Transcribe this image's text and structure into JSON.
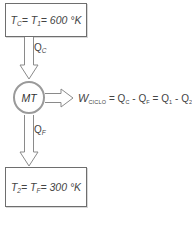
{
  "diagram": {
    "type": "heat-engine-schematic",
    "hot_reservoir": {
      "T_symbol": "T",
      "T_sub": "C",
      "eq1": "= ",
      "T1_symbol": "T",
      "T1_sub": "1",
      "value": "= 600 °K"
    },
    "cold_reservoir": {
      "T_symbol": "T",
      "T_sub": "2",
      "eq1": "= ",
      "Tf_symbol": "T",
      "Tf_sub": "F",
      "value": "= 300 °K"
    },
    "engine": {
      "label": "MT"
    },
    "heat_in": {
      "symbol": "Q",
      "sub": "C"
    },
    "heat_out": {
      "symbol": "Q",
      "sub": "F"
    },
    "work_equation": {
      "W": "W",
      "W_sub": "CICLO",
      "part1": " = Q",
      "part1_sub": "C",
      "part2": " - Q",
      "part2_sub": "F",
      "part3": " = Q",
      "part3_sub": "1",
      "part4": " - Q",
      "part4_sub": "2"
    },
    "colors": {
      "box_border": "#6e6e6e",
      "arrow_stroke": "#8a8a8a",
      "circle_border": "#9a9a9a",
      "text": "#444444"
    }
  }
}
